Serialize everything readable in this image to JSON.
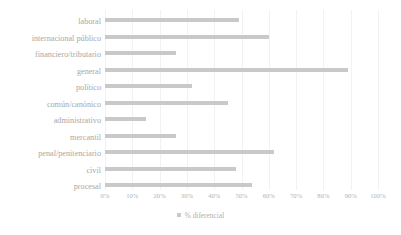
{
  "chart_data": {
    "type": "bar",
    "orientation": "horizontal",
    "title": "",
    "subtitle": "",
    "xlabel": "",
    "ylabel": "",
    "xlim": [
      0,
      100
    ],
    "grid": true,
    "legend_position": "bottom",
    "series": [
      {
        "name": "% diferencial",
        "color": "#c9c9c9",
        "values": [
          49,
          60,
          26,
          89,
          32,
          45,
          15,
          26,
          62,
          48,
          54
        ]
      }
    ],
    "categories": [
      "laboral",
      "internacional público",
      "financiero/tributario",
      "general",
      "político",
      "común/canónico",
      "administrativo",
      "mercantil",
      "penal/penitenciario",
      "civil",
      "procesal"
    ],
    "tick_labels": [
      "0%",
      "10%",
      "20%",
      "30%",
      "40%",
      "50%",
      "60%",
      "70%",
      "80%",
      "90%",
      "100%"
    ],
    "tick_values": [
      0,
      10,
      20,
      30,
      40,
      50,
      60,
      70,
      80,
      90,
      100
    ]
  },
  "legend": {
    "entries": [
      {
        "label": "% diferencial",
        "color": "#c9c9c9"
      }
    ]
  },
  "colors": {
    "bar": "#c9c9c9",
    "text": "#a8a8a8",
    "grid": "#f2f2f2",
    "background": "#ffffff"
  }
}
